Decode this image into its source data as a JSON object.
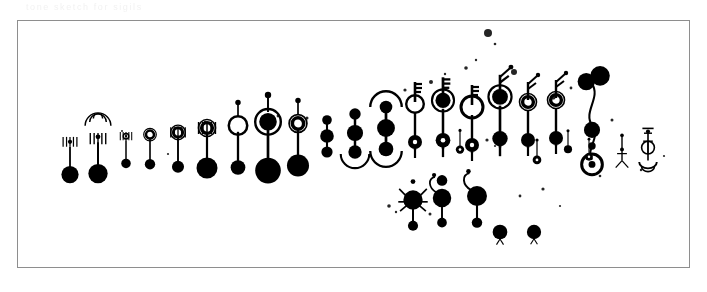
{
  "figure": {
    "title_faint": "tone  sketch   for   sigils",
    "subtitle_faint": "row  of   forms   seq",
    "note_faint": "serie  n   drift",
    "background_color": "#ffffff",
    "ink_color": "#000000",
    "frame_color": "#8e8e8e",
    "frame": {
      "x": 17,
      "y": 20,
      "width": 673,
      "height": 248
    }
  },
  "chart_data": {
    "type": "scatter",
    "title": "",
    "xlabel": "",
    "ylabel": "",
    "grid": false,
    "legend": "none",
    "glyphs": [
      {
        "id": "g01",
        "x": 70,
        "y": 150,
        "scale": 0.82,
        "kind": "stem-comb",
        "head": "small-dot",
        "body": "big-disc",
        "ornament": "tick-comb",
        "arc": null
      },
      {
        "id": "g02",
        "x": 98,
        "y": 146,
        "scale": 0.92,
        "kind": "stem-comb",
        "head": "small-dot",
        "body": "big-disc",
        "ornament": "radiating-fan",
        "arc": "fan-top"
      },
      {
        "id": "g03",
        "x": 126,
        "y": 143,
        "scale": 0.68,
        "kind": "ring-stem",
        "head": "ring-small",
        "body": "disc",
        "ornament": "tick-comb",
        "arc": null
      },
      {
        "id": "g04",
        "x": 150,
        "y": 142,
        "scale": 0.74,
        "kind": "ring-stem",
        "head": "ring-double",
        "body": "disc",
        "ornament": "none",
        "arc": null
      },
      {
        "id": "g05",
        "x": 178,
        "y": 141,
        "scale": 0.86,
        "kind": "ring-stem",
        "head": "ring-double",
        "body": "disc",
        "ornament": "tick-comb",
        "arc": null
      },
      {
        "id": "g06",
        "x": 207,
        "y": 138,
        "scale": 1.0,
        "kind": "ring-stem",
        "head": "ring-double",
        "body": "big-disc",
        "ornament": "tick-comb",
        "arc": null
      },
      {
        "id": "g07",
        "x": 238,
        "y": 136,
        "scale": 1.05,
        "kind": "ring-stem-lolli",
        "head": "ring-open",
        "body": "disc",
        "ornament": "pin-top",
        "arc": null
      },
      {
        "id": "g08",
        "x": 268,
        "y": 134,
        "scale": 1.22,
        "kind": "ring-stem-lolli",
        "head": "ring-thick",
        "body": "big-disc",
        "ornament": "pin-top",
        "arc": null
      },
      {
        "id": "g09",
        "x": 298,
        "y": 134,
        "scale": 1.05,
        "kind": "ring-stem-lolli",
        "head": "ring-double",
        "body": "big-disc",
        "ornament": "pin-top",
        "arc": null
      },
      {
        "id": "g10",
        "x": 327,
        "y": 136,
        "scale": 0.8,
        "kind": "dumbbell",
        "head": "disc",
        "body": "disc",
        "ornament": "none",
        "arc": null
      },
      {
        "id": "g11",
        "x": 355,
        "y": 133,
        "scale": 0.95,
        "kind": "dumbbell",
        "head": "disc",
        "body": "disc",
        "ornament": "none",
        "arc": "bottom-cup"
      },
      {
        "id": "g12",
        "x": 386,
        "y": 128,
        "scale": 1.05,
        "kind": "dumbbell",
        "head": "disc",
        "body": "disc",
        "ornament": "none",
        "arc": "both-cup"
      },
      {
        "id": "g13",
        "x": 415,
        "y": 116,
        "scale": 1.0,
        "kind": "key",
        "head": "ring-open",
        "body": "ring-dot",
        "ornament": "key-teeth",
        "arc": null
      },
      {
        "id": "g14",
        "x": 443,
        "y": 113,
        "scale": 1.05,
        "kind": "key",
        "head": "ring-thick",
        "body": "ring-dot",
        "ornament": "key-teeth",
        "arc": null
      },
      {
        "id": "g15",
        "x": 472,
        "y": 119,
        "scale": 1.0,
        "kind": "key",
        "head": "ring-open-xl",
        "body": "ring-dot",
        "ornament": "key-teeth",
        "arc": null
      },
      {
        "id": "g16",
        "x": 500,
        "y": 110,
        "scale": 1.1,
        "kind": "key",
        "head": "ring-thick",
        "body": "disc",
        "ornament": "antenna",
        "arc": null
      },
      {
        "id": "g17",
        "x": 528,
        "y": 114,
        "scale": 1.0,
        "kind": "key",
        "head": "ring-double",
        "body": "disc",
        "ornament": "antenna",
        "arc": null
      },
      {
        "id": "g18",
        "x": 556,
        "y": 112,
        "scale": 1.0,
        "kind": "key",
        "head": "ring-double",
        "body": "disc",
        "ornament": "antenna",
        "arc": null
      },
      {
        "id": "g19",
        "x": 592,
        "y": 100,
        "scale": 1.15,
        "kind": "wiggle-chain",
        "head": "disc-pair",
        "body": "disc",
        "ornament": "squiggle",
        "arc": null
      },
      {
        "id": "g20",
        "x": 622,
        "y": 148,
        "scale": 0.7,
        "kind": "tripod",
        "head": "small-dot",
        "body": "small-dot",
        "ornament": "legs",
        "arc": null
      },
      {
        "id": "g21",
        "x": 648,
        "y": 146,
        "scale": 0.8,
        "kind": "tripod",
        "head": "small-dot",
        "body": "ring-bar",
        "ornament": "cross-bars",
        "arc": "bottom-bowl"
      },
      {
        "id": "g22",
        "x": 413,
        "y": 200,
        "scale": 0.92,
        "kind": "spider",
        "head": "small-dot",
        "body": "big-disc",
        "ornament": "side-legs",
        "arc": null
      },
      {
        "id": "g23",
        "x": 442,
        "y": 198,
        "scale": 0.88,
        "kind": "hook-stem",
        "head": "disc",
        "body": "big-disc",
        "ornament": "hook",
        "arc": null
      },
      {
        "id": "g24",
        "x": 477,
        "y": 196,
        "scale": 0.95,
        "kind": "hook-stem",
        "head": "none",
        "body": "big-disc",
        "ornament": "hook",
        "arc": null
      },
      {
        "id": "g25",
        "x": 500,
        "y": 232,
        "scale": 0.7,
        "kind": "droplet",
        "head": "none",
        "body": "big-disc",
        "ornament": "tail",
        "arc": null
      },
      {
        "id": "g26",
        "x": 534,
        "y": 232,
        "scale": 0.68,
        "kind": "droplet",
        "head": "none",
        "body": "big-disc",
        "ornament": "tail",
        "arc": null
      },
      {
        "id": "g27",
        "x": 460,
        "y": 140,
        "scale": 0.6,
        "kind": "pin-stack",
        "head": "small-dot",
        "body": "ring-dot",
        "ornament": "none",
        "arc": null
      },
      {
        "id": "g28",
        "x": 537,
        "y": 150,
        "scale": 0.62,
        "kind": "pin-stack",
        "head": "small-dot",
        "body": "ring-dot",
        "ornament": "none",
        "arc": null
      },
      {
        "id": "g29",
        "x": 568,
        "y": 140,
        "scale": 0.58,
        "kind": "pin-stack",
        "head": "small-dot",
        "body": "disc",
        "ornament": "none",
        "arc": null
      },
      {
        "id": "g30",
        "x": 589,
        "y": 148,
        "scale": 0.55,
        "kind": "pin-stack",
        "head": "small-dot",
        "body": "ring-dot",
        "ornament": "none",
        "arc": null
      }
    ],
    "specks": [
      {
        "x": 488,
        "y": 33,
        "r": 4.0,
        "blur": 1.2
      },
      {
        "x": 495,
        "y": 44,
        "r": 1.3,
        "blur": 0.5
      },
      {
        "x": 431,
        "y": 82,
        "r": 2.0,
        "blur": 0.6
      },
      {
        "x": 445,
        "y": 74,
        "r": 1.2,
        "blur": 0.4
      },
      {
        "x": 405,
        "y": 90,
        "r": 1.6,
        "blur": 0.5
      },
      {
        "x": 466,
        "y": 68,
        "r": 1.8,
        "blur": 0.5
      },
      {
        "x": 476,
        "y": 60,
        "r": 1.2,
        "blur": 0.4
      },
      {
        "x": 514,
        "y": 72,
        "r": 3.0,
        "blur": 1.0
      },
      {
        "x": 553,
        "y": 97,
        "r": 2.6,
        "blur": 0.9
      },
      {
        "x": 571,
        "y": 88,
        "r": 1.4,
        "blur": 0.5
      },
      {
        "x": 487,
        "y": 140,
        "r": 1.6,
        "blur": 0.4
      },
      {
        "x": 495,
        "y": 146,
        "r": 1.1,
        "blur": 0.4
      },
      {
        "x": 389,
        "y": 206,
        "r": 1.8,
        "blur": 0.5
      },
      {
        "x": 396,
        "y": 212,
        "r": 1.2,
        "blur": 0.4
      },
      {
        "x": 430,
        "y": 214,
        "r": 1.5,
        "blur": 0.4
      },
      {
        "x": 520,
        "y": 196,
        "r": 1.4,
        "blur": 0.5
      },
      {
        "x": 543,
        "y": 189,
        "r": 1.6,
        "blur": 0.5
      },
      {
        "x": 560,
        "y": 206,
        "r": 1.1,
        "blur": 0.4
      },
      {
        "x": 307,
        "y": 118,
        "r": 1.5,
        "blur": 0.4
      },
      {
        "x": 278,
        "y": 116,
        "r": 1.4,
        "blur": 0.4
      },
      {
        "x": 205,
        "y": 122,
        "r": 1.2,
        "blur": 0.4
      },
      {
        "x": 168,
        "y": 154,
        "r": 1.1,
        "blur": 0.4
      },
      {
        "x": 122,
        "y": 131,
        "r": 1.0,
        "blur": 0.4
      },
      {
        "x": 612,
        "y": 120,
        "r": 1.5,
        "blur": 0.5
      },
      {
        "x": 600,
        "y": 176,
        "r": 1.3,
        "blur": 0.4
      },
      {
        "x": 641,
        "y": 170,
        "r": 1.2,
        "blur": 0.4
      },
      {
        "x": 664,
        "y": 156,
        "r": 1.1,
        "blur": 0.4
      }
    ]
  }
}
